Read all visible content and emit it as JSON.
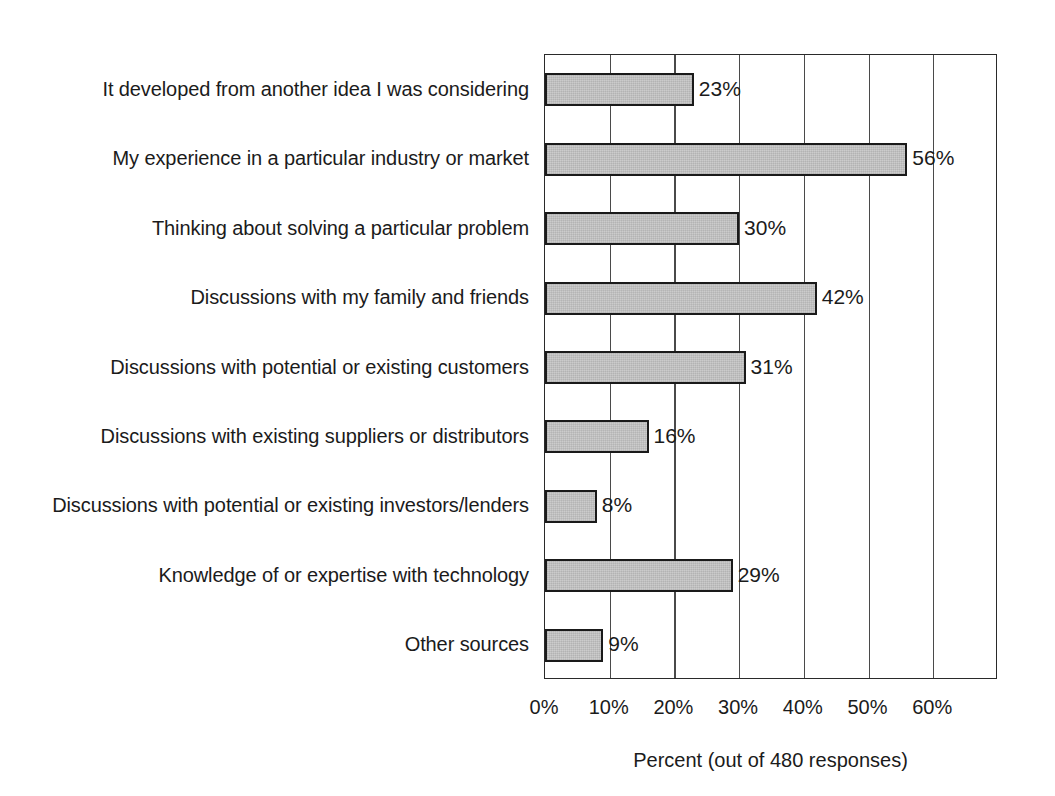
{
  "chart_data": {
    "type": "bar",
    "orientation": "horizontal",
    "title": "",
    "xlabel": "Percent (out of 480 responses)",
    "ylabel": "",
    "categories": [
      "It developed from another idea I was considering",
      "My experience in a particular industry or market",
      "Thinking about solving a particular problem",
      "Discussions with my family and friends",
      "Discussions with potential or existing customers",
      "Discussions with existing suppliers or distributors",
      "Discussions with potential or existing investors/lenders",
      "Knowledge of or expertise with technology",
      "Other sources"
    ],
    "values": [
      23,
      56,
      30,
      42,
      31,
      16,
      8,
      29,
      9
    ],
    "value_labels": [
      "23%",
      "56%",
      "30%",
      "42%",
      "31%",
      "16%",
      "8%",
      "29%",
      "9%"
    ],
    "xlim": [
      0,
      70
    ],
    "xticks": [
      0,
      10,
      20,
      30,
      40,
      50,
      60
    ],
    "xtick_labels": [
      "0%",
      "10%",
      "20%",
      "30%",
      "40%",
      "50%",
      "60%"
    ],
    "grid": "vertical",
    "legend": "none",
    "bar_fill_color": "#c6c6c6",
    "bar_edge_color": "#1a1a1a",
    "axis_color": "#2a2a2a",
    "background_color": "#ffffff",
    "n_responses": 480
  }
}
